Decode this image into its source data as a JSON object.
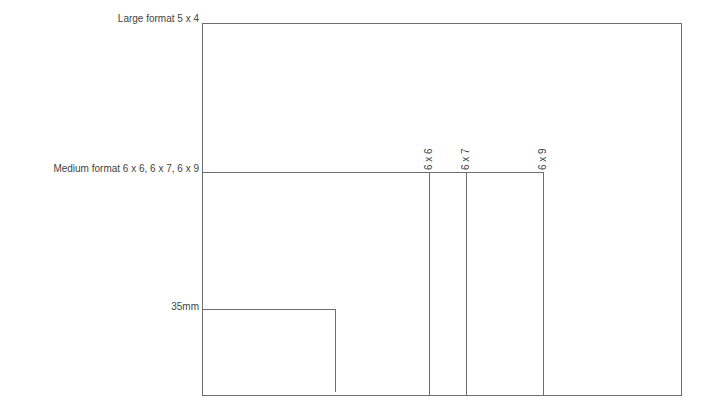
{
  "diagram": {
    "labels": {
      "large": "Large format 5 x 4",
      "medium": "Medium format 6 x 6, 6 x 7, 6 x 9",
      "small": "35mm"
    },
    "medium_sub_labels": [
      "6 x 6",
      "6 x 7",
      "6 x 9"
    ],
    "line_color": "#6e6e6e",
    "text_color": "#444444"
  }
}
